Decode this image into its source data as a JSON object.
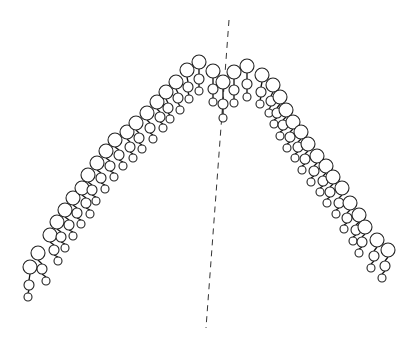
{
  "diagram": {
    "type": "symmetry-fold-of-chained-circle-units",
    "colors": {
      "stroke": "#222222",
      "background": "#ffffff",
      "axis": "#333333"
    },
    "axis": {
      "style": "dashed",
      "x1": 229,
      "y1": 20,
      "x2": 206,
      "y2": 328
    },
    "unit_shape": {
      "large_r": 7,
      "medium_r": 5,
      "small_r": 4
    },
    "left_arm": [
      {
        "x": 30,
        "y": 267,
        "dx": -1,
        "l1": 18,
        "l2": 12
      },
      {
        "x": 38,
        "y": 253,
        "dx": 4,
        "l1": 16,
        "l2": 12
      },
      {
        "x": 50,
        "y": 235,
        "dx": 4,
        "l1": 15,
        "l2": 11
      },
      {
        "x": 57,
        "y": 222,
        "dx": 4,
        "l1": 15,
        "l2": 11
      },
      {
        "x": 65,
        "y": 210,
        "dx": 4,
        "l1": 15,
        "l2": 11
      },
      {
        "x": 73,
        "y": 198,
        "dx": 4,
        "l1": 15,
        "l2": 11
      },
      {
        "x": 82,
        "y": 188,
        "dx": 4,
        "l1": 15,
        "l2": 11
      },
      {
        "x": 88,
        "y": 175,
        "dx": 4,
        "l1": 15,
        "l2": 11
      },
      {
        "x": 97,
        "y": 163,
        "dx": 4,
        "l1": 15,
        "l2": 11
      },
      {
        "x": 106,
        "y": 151,
        "dx": 4,
        "l1": 15,
        "l2": 11
      },
      {
        "x": 115,
        "y": 140,
        "dx": 4,
        "l1": 15,
        "l2": 11
      },
      {
        "x": 127,
        "y": 132,
        "dx": 3,
        "l1": 15,
        "l2": 11
      },
      {
        "x": 136,
        "y": 123,
        "dx": 3,
        "l1": 15,
        "l2": 11
      },
      {
        "x": 147,
        "y": 113,
        "dx": 3,
        "l1": 15,
        "l2": 11
      },
      {
        "x": 157,
        "y": 102,
        "dx": 3,
        "l1": 15,
        "l2": 11
      },
      {
        "x": 166,
        "y": 92,
        "dx": 2,
        "l1": 16,
        "l2": 11
      },
      {
        "x": 176,
        "y": 82,
        "dx": 2,
        "l1": 16,
        "l2": 12
      },
      {
        "x": 187,
        "y": 70,
        "dx": 1,
        "l1": 17,
        "l2": 12
      },
      {
        "x": 199,
        "y": 62,
        "dx": 0,
        "l1": 17,
        "l2": 12
      }
    ],
    "right_arm": [
      {
        "x": 213,
        "y": 71,
        "dx": 0,
        "l1": 18,
        "l2": 13
      },
      {
        "x": 223,
        "y": 82,
        "dx": 0,
        "l1": 22,
        "l2": 14
      },
      {
        "x": 234,
        "y": 72,
        "dx": 0,
        "l1": 18,
        "l2": 13
      },
      {
        "x": 247,
        "y": 66,
        "dx": 0,
        "l1": 18,
        "l2": 13
      },
      {
        "x": 262,
        "y": 75,
        "dx": -1,
        "l1": 17,
        "l2": 12
      },
      {
        "x": 273,
        "y": 85,
        "dx": -2,
        "l1": 16,
        "l2": 12
      },
      {
        "x": 280,
        "y": 97,
        "dx": -3,
        "l1": 16,
        "l2": 11
      },
      {
        "x": 286,
        "y": 110,
        "dx": -3,
        "l1": 15,
        "l2": 11
      },
      {
        "x": 293,
        "y": 122,
        "dx": -3,
        "l1": 15,
        "l2": 11
      },
      {
        "x": 301,
        "y": 132,
        "dx": -3,
        "l1": 15,
        "l2": 11
      },
      {
        "x": 308,
        "y": 144,
        "dx": -3,
        "l1": 15,
        "l2": 11
      },
      {
        "x": 317,
        "y": 156,
        "dx": -3,
        "l1": 15,
        "l2": 11
      },
      {
        "x": 326,
        "y": 166,
        "dx": -3,
        "l1": 15,
        "l2": 11
      },
      {
        "x": 333,
        "y": 177,
        "dx": -3,
        "l1": 15,
        "l2": 11
      },
      {
        "x": 342,
        "y": 188,
        "dx": -3,
        "l1": 15,
        "l2": 11
      },
      {
        "x": 350,
        "y": 203,
        "dx": -3,
        "l1": 15,
        "l2": 11
      },
      {
        "x": 359,
        "y": 215,
        "dx": -3,
        "l1": 15,
        "l2": 11
      },
      {
        "x": 365,
        "y": 227,
        "dx": -3,
        "l1": 15,
        "l2": 11
      },
      {
        "x": 377,
        "y": 240,
        "dx": -3,
        "l1": 16,
        "l2": 12
      },
      {
        "x": 388,
        "y": 250,
        "dx": -3,
        "l1": 16,
        "l2": 12
      }
    ]
  }
}
